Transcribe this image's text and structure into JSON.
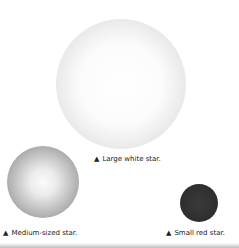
{
  "figure": {
    "stars": [
      {
        "id": "large",
        "caption": "Large white star.",
        "marker": "▲"
      },
      {
        "id": "medium",
        "caption": "Medium-sized star.",
        "marker": "▲"
      },
      {
        "id": "small",
        "caption": "Small red star.",
        "marker": "▲"
      }
    ]
  }
}
